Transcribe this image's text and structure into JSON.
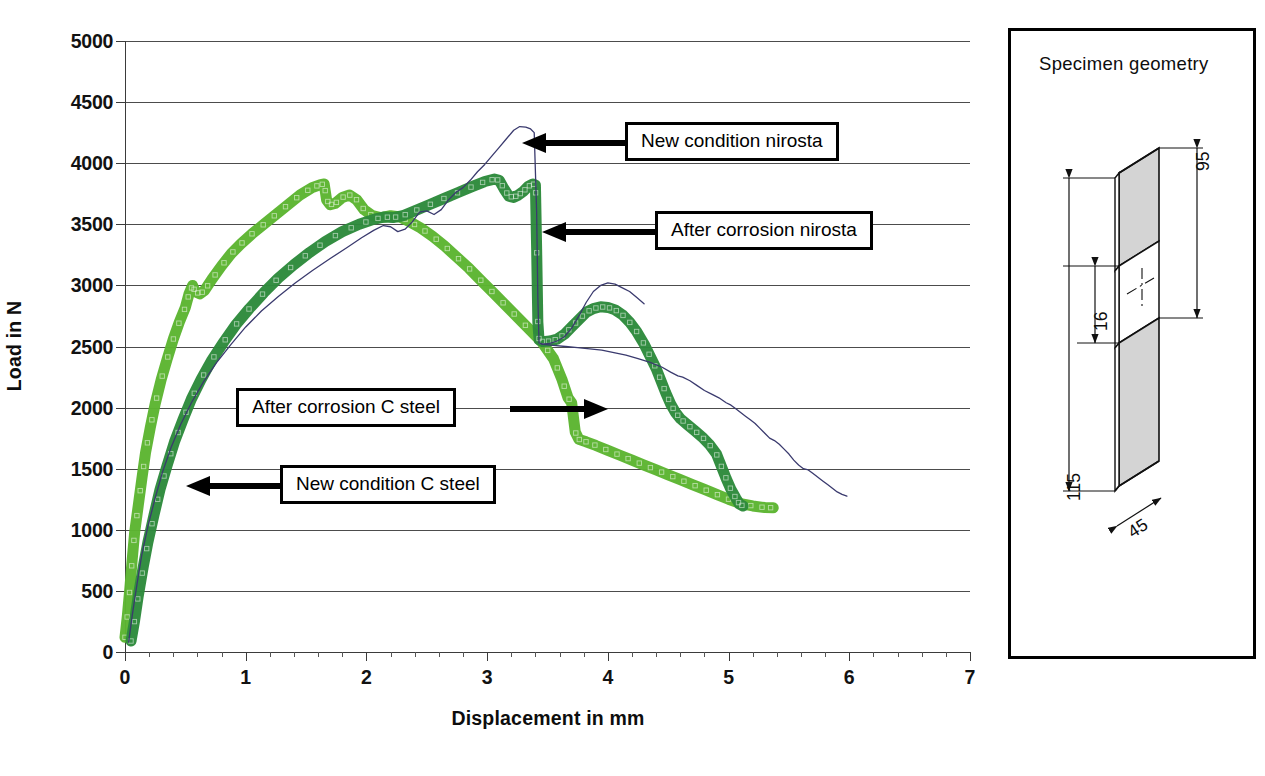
{
  "figure": {
    "background": "#ffffff",
    "width": 1265,
    "height": 776
  },
  "axis": {
    "y_title": "Load in N",
    "x_title": "Displacement in mm",
    "y_ticks": [
      "0",
      "500",
      "1000",
      "1500",
      "2000",
      "2500",
      "3000",
      "3500",
      "4000",
      "4500",
      "5000"
    ],
    "x_ticks": [
      "0",
      "1",
      "2",
      "3",
      "4",
      "5",
      "6",
      "7"
    ]
  },
  "callouts": {
    "new_nirosta": "New condition nirosta",
    "after_nirosta": "After  corrosion nirosta",
    "after_csteel": "After  corrosion C steel",
    "new_csteel": "New condition C steel"
  },
  "specimen": {
    "title": "Specimen geometry",
    "dim_height_total": "115",
    "dim_height_gauge": "95",
    "dim_notch": "16",
    "dim_width": "45"
  },
  "colors": {
    "light_green": "#5cb531",
    "dark_green": "#2d8a3c",
    "thin_line": "#3a3a6e",
    "grid": "#4c4c4c",
    "axis": "#3b3b3b",
    "text": "#111111"
  },
  "chart_data": {
    "type": "line",
    "title": "",
    "xlabel": "Displacement in mm",
    "ylabel": "Load in N",
    "xlim": [
      0,
      7
    ],
    "ylim": [
      0,
      5000
    ],
    "xticks": [
      0,
      1,
      2,
      3,
      4,
      5,
      6,
      7
    ],
    "yticks": [
      0,
      500,
      1000,
      1500,
      2000,
      2500,
      3000,
      3500,
      4000,
      4500,
      5000
    ],
    "x_minor_tick_step": 0.2,
    "grid": "horizontal",
    "legend": "annotations",
    "series": [
      {
        "name": "New condition C steel",
        "color": "#5cb531",
        "style": "thick-marker-trace",
        "points": [
          [
            0.0,
            120
          ],
          [
            0.02,
            300
          ],
          [
            0.04,
            520
          ],
          [
            0.06,
            760
          ],
          [
            0.08,
            980
          ],
          [
            0.11,
            1200
          ],
          [
            0.14,
            1420
          ],
          [
            0.17,
            1630
          ],
          [
            0.21,
            1840
          ],
          [
            0.25,
            2030
          ],
          [
            0.3,
            2230
          ],
          [
            0.35,
            2400
          ],
          [
            0.4,
            2560
          ],
          [
            0.45,
            2700
          ],
          [
            0.5,
            2820
          ],
          [
            0.53,
            2930
          ],
          [
            0.56,
            3000
          ],
          [
            0.58,
            2950
          ],
          [
            0.62,
            2930
          ],
          [
            0.66,
            2960
          ],
          [
            0.72,
            3050
          ],
          [
            0.8,
            3160
          ],
          [
            0.88,
            3260
          ],
          [
            0.96,
            3340
          ],
          [
            1.05,
            3420
          ],
          [
            1.15,
            3500
          ],
          [
            1.25,
            3580
          ],
          [
            1.35,
            3660
          ],
          [
            1.45,
            3740
          ],
          [
            1.55,
            3800
          ],
          [
            1.62,
            3825
          ],
          [
            1.65,
            3830
          ],
          [
            1.67,
            3700
          ],
          [
            1.7,
            3660
          ],
          [
            1.74,
            3670
          ],
          [
            1.8,
            3720
          ],
          [
            1.86,
            3740
          ],
          [
            1.92,
            3700
          ],
          [
            1.98,
            3620
          ],
          [
            2.05,
            3570
          ],
          [
            2.12,
            3555
          ],
          [
            2.2,
            3570
          ],
          [
            2.28,
            3560
          ],
          [
            2.36,
            3520
          ],
          [
            2.45,
            3470
          ],
          [
            2.55,
            3400
          ],
          [
            2.65,
            3320
          ],
          [
            2.75,
            3230
          ],
          [
            2.85,
            3140
          ],
          [
            2.95,
            3040
          ],
          [
            3.05,
            2940
          ],
          [
            3.15,
            2840
          ],
          [
            3.25,
            2740
          ],
          [
            3.35,
            2640
          ],
          [
            3.45,
            2540
          ],
          [
            3.55,
            2400
          ],
          [
            3.62,
            2230
          ],
          [
            3.67,
            2080
          ],
          [
            3.7,
            2040
          ],
          [
            3.73,
            1800
          ],
          [
            3.76,
            1740
          ],
          [
            3.82,
            1720
          ],
          [
            3.9,
            1690
          ],
          [
            4.0,
            1650
          ],
          [
            4.1,
            1610
          ],
          [
            4.2,
            1570
          ],
          [
            4.3,
            1530
          ],
          [
            4.4,
            1490
          ],
          [
            4.5,
            1450
          ],
          [
            4.6,
            1410
          ],
          [
            4.7,
            1370
          ],
          [
            4.8,
            1330
          ],
          [
            4.9,
            1290
          ],
          [
            5.0,
            1250
          ],
          [
            5.1,
            1215
          ],
          [
            5.2,
            1195
          ],
          [
            5.3,
            1182
          ],
          [
            5.37,
            1180
          ]
        ]
      },
      {
        "name": "After corrosion C steel",
        "color": "#2d8a3c",
        "style": "thick-marker-trace",
        "points": [
          [
            0.05,
            90
          ],
          [
            0.08,
            260
          ],
          [
            0.11,
            460
          ],
          [
            0.15,
            690
          ],
          [
            0.19,
            900
          ],
          [
            0.24,
            1120
          ],
          [
            0.29,
            1330
          ],
          [
            0.35,
            1530
          ],
          [
            0.41,
            1720
          ],
          [
            0.48,
            1900
          ],
          [
            0.55,
            2070
          ],
          [
            0.63,
            2230
          ],
          [
            0.72,
            2390
          ],
          [
            0.82,
            2540
          ],
          [
            0.92,
            2680
          ],
          [
            1.03,
            2810
          ],
          [
            1.15,
            2940
          ],
          [
            1.27,
            3060
          ],
          [
            1.4,
            3170
          ],
          [
            1.53,
            3270
          ],
          [
            1.66,
            3360
          ],
          [
            1.8,
            3440
          ],
          [
            1.94,
            3500
          ],
          [
            2.06,
            3540
          ],
          [
            2.15,
            3560
          ],
          [
            2.22,
            3555
          ],
          [
            2.3,
            3570
          ],
          [
            2.4,
            3610
          ],
          [
            2.52,
            3660
          ],
          [
            2.64,
            3710
          ],
          [
            2.76,
            3760
          ],
          [
            2.88,
            3810
          ],
          [
            2.98,
            3850
          ],
          [
            3.06,
            3870
          ],
          [
            3.1,
            3860
          ],
          [
            3.14,
            3790
          ],
          [
            3.18,
            3730
          ],
          [
            3.22,
            3720
          ],
          [
            3.26,
            3740
          ],
          [
            3.3,
            3770
          ],
          [
            3.34,
            3810
          ],
          [
            3.38,
            3830
          ],
          [
            3.4,
            3820
          ],
          [
            3.41,
            3300
          ],
          [
            3.42,
            2700
          ],
          [
            3.43,
            2555
          ],
          [
            3.46,
            2540
          ],
          [
            3.52,
            2545
          ],
          [
            3.58,
            2560
          ],
          [
            3.64,
            2600
          ],
          [
            3.7,
            2660
          ],
          [
            3.76,
            2720
          ],
          [
            3.82,
            2780
          ],
          [
            3.88,
            2810
          ],
          [
            3.94,
            2825
          ],
          [
            4.0,
            2820
          ],
          [
            4.06,
            2800
          ],
          [
            4.12,
            2760
          ],
          [
            4.18,
            2700
          ],
          [
            4.24,
            2620
          ],
          [
            4.3,
            2520
          ],
          [
            4.35,
            2420
          ],
          [
            4.4,
            2320
          ],
          [
            4.44,
            2220
          ],
          [
            4.48,
            2120
          ],
          [
            4.52,
            2030
          ],
          [
            4.56,
            1960
          ],
          [
            4.6,
            1910
          ],
          [
            4.66,
            1860
          ],
          [
            4.72,
            1810
          ],
          [
            4.78,
            1760
          ],
          [
            4.84,
            1700
          ],
          [
            4.9,
            1620
          ],
          [
            4.94,
            1520
          ],
          [
            4.98,
            1420
          ],
          [
            5.02,
            1330
          ],
          [
            5.06,
            1260
          ],
          [
            5.09,
            1210
          ],
          [
            5.12,
            1195
          ]
        ]
      },
      {
        "name": "New condition nirosta",
        "color": "#3a3a6e",
        "style": "thin-line",
        "points": [
          [
            0.03,
            80
          ],
          [
            0.06,
            300
          ],
          [
            0.1,
            560
          ],
          [
            0.14,
            800
          ],
          [
            0.19,
            1030
          ],
          [
            0.25,
            1260
          ],
          [
            0.31,
            1470
          ],
          [
            0.38,
            1670
          ],
          [
            0.46,
            1860
          ],
          [
            0.55,
            2040
          ],
          [
            0.65,
            2210
          ],
          [
            0.76,
            2370
          ],
          [
            0.88,
            2520
          ],
          [
            1.0,
            2660
          ],
          [
            1.13,
            2790
          ],
          [
            1.27,
            2910
          ],
          [
            1.41,
            3020
          ],
          [
            1.55,
            3120
          ],
          [
            1.7,
            3220
          ],
          [
            1.84,
            3310
          ],
          [
            1.96,
            3390
          ],
          [
            2.06,
            3450
          ],
          [
            2.14,
            3490
          ],
          [
            2.2,
            3480
          ],
          [
            2.26,
            3440
          ],
          [
            2.32,
            3460
          ],
          [
            2.38,
            3520
          ],
          [
            2.44,
            3600
          ],
          [
            2.5,
            3610
          ],
          [
            2.56,
            3580
          ],
          [
            2.62,
            3620
          ],
          [
            2.68,
            3700
          ],
          [
            2.74,
            3760
          ],
          [
            2.8,
            3800
          ],
          [
            2.86,
            3860
          ],
          [
            2.92,
            3930
          ],
          [
            2.98,
            3990
          ],
          [
            3.04,
            4060
          ],
          [
            3.1,
            4130
          ],
          [
            3.16,
            4200
          ],
          [
            3.22,
            4270
          ],
          [
            3.27,
            4300
          ],
          [
            3.32,
            4295
          ],
          [
            3.36,
            4280
          ],
          [
            3.39,
            4250
          ],
          [
            3.41,
            3600
          ],
          [
            3.42,
            2900
          ],
          [
            3.43,
            2530
          ],
          [
            3.46,
            2520
          ],
          [
            3.52,
            2525
          ],
          [
            3.58,
            2545
          ],
          [
            3.64,
            2580
          ],
          [
            3.7,
            2650
          ],
          [
            3.76,
            2750
          ],
          [
            3.82,
            2860
          ],
          [
            3.88,
            2950
          ],
          [
            3.94,
            3000
          ],
          [
            4.0,
            3020
          ],
          [
            4.06,
            3010
          ],
          [
            4.12,
            2980
          ],
          [
            4.18,
            2950
          ],
          [
            4.24,
            2900
          ],
          [
            4.3,
            2850
          ]
        ]
      },
      {
        "name": "After corrosion nirosta",
        "color": "#3a3a6e",
        "style": "thin-line",
        "points": [
          [
            3.45,
            2520
          ],
          [
            3.55,
            2510
          ],
          [
            3.65,
            2500
          ],
          [
            3.75,
            2490
          ],
          [
            3.85,
            2480
          ],
          [
            3.95,
            2470
          ],
          [
            4.05,
            2450
          ],
          [
            4.15,
            2430
          ],
          [
            4.25,
            2400
          ],
          [
            4.35,
            2370
          ],
          [
            4.45,
            2330
          ],
          [
            4.52,
            2290
          ],
          [
            4.58,
            2260
          ],
          [
            4.62,
            2250
          ],
          [
            4.68,
            2220
          ],
          [
            4.74,
            2180
          ],
          [
            4.8,
            2140
          ],
          [
            4.86,
            2110
          ],
          [
            4.92,
            2080
          ],
          [
            4.98,
            2040
          ],
          [
            5.02,
            2020
          ],
          [
            5.06,
            1990
          ],
          [
            5.1,
            1960
          ],
          [
            5.14,
            1930
          ],
          [
            5.18,
            1900
          ],
          [
            5.22,
            1870
          ],
          [
            5.26,
            1830
          ],
          [
            5.3,
            1790
          ],
          [
            5.34,
            1750
          ],
          [
            5.38,
            1730
          ],
          [
            5.42,
            1700
          ],
          [
            5.46,
            1660
          ],
          [
            5.5,
            1620
          ],
          [
            5.54,
            1570
          ],
          [
            5.58,
            1530
          ],
          [
            5.62,
            1500
          ],
          [
            5.66,
            1490
          ],
          [
            5.7,
            1460
          ],
          [
            5.74,
            1430
          ],
          [
            5.78,
            1400
          ],
          [
            5.82,
            1370
          ],
          [
            5.86,
            1340
          ],
          [
            5.9,
            1310
          ],
          [
            5.94,
            1290
          ],
          [
            5.98,
            1275
          ]
        ]
      }
    ]
  }
}
